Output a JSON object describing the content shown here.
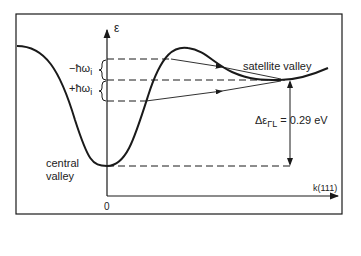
{
  "diagram": {
    "axes": {
      "y_label": "ε",
      "x_label": "k(111)",
      "origin_label": "0"
    },
    "labels": {
      "central_valley_line1": "central",
      "central_valley_line2": "valley",
      "satellite_valley": "satellite valley",
      "minus_phonon": "−ħω",
      "minus_phonon_sub": "i",
      "plus_phonon": "+ħω",
      "plus_phonon_sub": "i",
      "energy_gap": "Δε",
      "energy_gap_sub": "ΓL",
      "energy_gap_value": "= 0.29 eV"
    },
    "colors": {
      "line": "#1a1a1a",
      "background": "#ffffff"
    }
  }
}
